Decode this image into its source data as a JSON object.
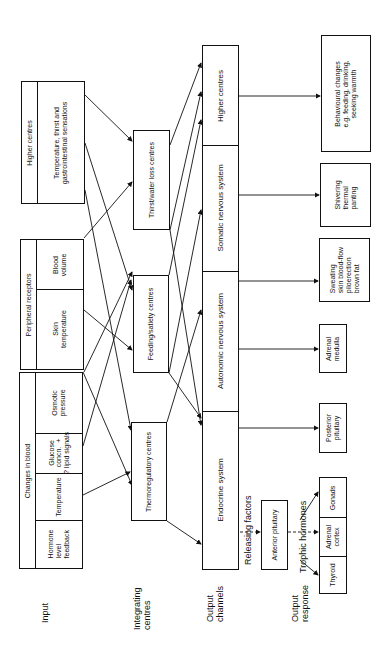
{
  "row_labels": {
    "input": "Input",
    "integrating": "Integrating\ncentres",
    "output_channels": "Output\nchannels",
    "output_response": "Output\nresponse"
  },
  "inputs": {
    "higher_centres": {
      "header": "Higher centres",
      "items": [
        "Temperature, thirst and\ngastrointestinal sensations"
      ]
    },
    "peripheral_receptors": {
      "header": "Peripheral receptors",
      "items": [
        "Blood\nvolume",
        "Skin\ntemperature"
      ]
    },
    "changes_in_blood": {
      "header": "Changes in blood",
      "items": [
        "Osmotic\npressure",
        "Glucose\nconcn.  +\n? lipid signals",
        "Temperature",
        "Hormone\nlevel\nfeedback"
      ]
    }
  },
  "integrating_centres": [
    "Thirst/water loss centres",
    "Feeding/satiety centres",
    "Thermoregulatory centres"
  ],
  "output_channels": [
    "Higher centres",
    "Somatic nervous system",
    "Autonomic nervous system",
    "Endocrine system"
  ],
  "endocrine_path": {
    "releasing_factors": "Releasing factors",
    "anterior_pituitary": "Anterior pituitary",
    "trophic_hormones": "Trophic hormones",
    "targets": [
      "Gonads",
      "Adrenal\ncortex",
      "Thyroid"
    ]
  },
  "output_responses": {
    "behavioural": "Behavioural changes\ne.g. feeding, drinking,\nseeking warmth",
    "shivering": "Shivering\nthermal\npanting",
    "sweating": "Sweating\nskin blood-flow\npiloerection\nbrown fat",
    "adrenal_medulla": "Adrenal\nmedulla",
    "posterior_pituitary": "Posterior\npituitary"
  },
  "colors": {
    "line": "#111111",
    "background": "#ffffff"
  }
}
